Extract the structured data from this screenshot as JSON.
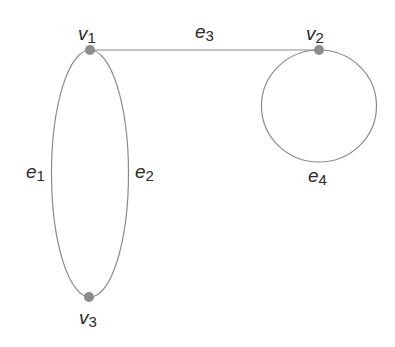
{
  "diagram": {
    "type": "graph",
    "edge_color": "#8a8a8a",
    "vertex_color": "#8c8c8c",
    "vertices": [
      {
        "id": "v1",
        "base": "v",
        "sub": "1",
        "x": 90,
        "y": 50
      },
      {
        "id": "v2",
        "base": "v",
        "sub": "2",
        "x": 319,
        "y": 50
      },
      {
        "id": "v3",
        "base": "v",
        "sub": "3",
        "x": 89,
        "y": 297
      }
    ],
    "edges": [
      {
        "id": "e1",
        "base": "e",
        "sub": "1",
        "from": "v1",
        "to": "v3",
        "shape": "left arc"
      },
      {
        "id": "e2",
        "base": "e",
        "sub": "2",
        "from": "v1",
        "to": "v3",
        "shape": "right arc"
      },
      {
        "id": "e3",
        "base": "e",
        "sub": "3",
        "from": "v1",
        "to": "v2",
        "shape": "line"
      },
      {
        "id": "e4",
        "base": "e",
        "sub": "4",
        "from": "v2",
        "to": "v2",
        "shape": "loop"
      }
    ]
  }
}
